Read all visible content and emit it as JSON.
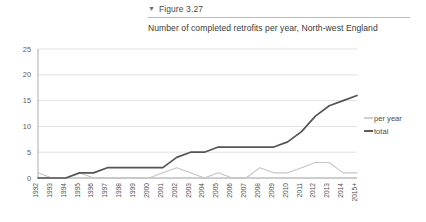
{
  "header": {
    "caret_icon": "▼",
    "caption": "Figure 3.27",
    "title": "Number of completed retrofits per year, North-west England"
  },
  "legend": {
    "position": "right",
    "items": [
      {
        "label": "per year",
        "color": "#c4c4c4"
      },
      {
        "label": "total",
        "color": "#555555"
      }
    ]
  },
  "chart_data": {
    "type": "line",
    "title": "Number of completed retrofits per year, North-west England",
    "xlabel": "",
    "ylabel": "",
    "ylim": [
      0,
      25
    ],
    "yticks": [
      0,
      5,
      10,
      15,
      20,
      25
    ],
    "grid": true,
    "legend_position": "right",
    "categories": [
      "1992",
      "1993",
      "1994",
      "1995",
      "1996",
      "1997",
      "1998",
      "1999",
      "2000",
      "2001",
      "2002",
      "2003",
      "2004",
      "2005",
      "2006",
      "2007",
      "2008",
      "2009",
      "2010",
      "2011",
      "2012",
      "2013",
      "2014",
      "2015+"
    ],
    "series": [
      {
        "name": "per year",
        "color": "#c4c4c4",
        "values": [
          1,
          0,
          0,
          1,
          0,
          0,
          0,
          0,
          0,
          1,
          2,
          1,
          0,
          1,
          0,
          0,
          2,
          1,
          1,
          2,
          3,
          3,
          1,
          1
        ]
      },
      {
        "name": "total",
        "color": "#555555",
        "values": [
          0,
          0,
          0,
          1,
          1,
          2,
          2,
          2,
          2,
          2,
          4,
          5,
          5,
          6,
          6,
          6,
          6,
          6,
          7,
          9,
          12,
          14,
          15,
          16
        ]
      }
    ]
  }
}
